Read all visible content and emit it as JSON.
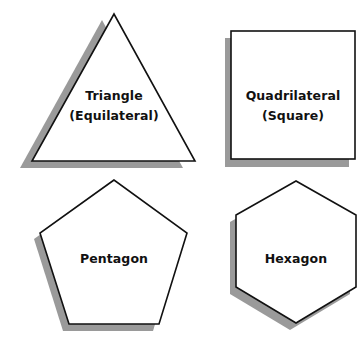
{
  "diagram": {
    "shadow_color": "#9a9a9a",
    "stroke_color": "#111111",
    "fill_color": "#ffffff",
    "shapes": [
      {
        "name": "triangle",
        "line1": "Triangle",
        "line2": "(Equilateral)"
      },
      {
        "name": "quadrilateral",
        "line1": "Quadrilateral",
        "line2": "(Square)"
      },
      {
        "name": "pentagon",
        "line1": "Pentagon"
      },
      {
        "name": "hexagon",
        "line1": "Hexagon"
      }
    ]
  }
}
